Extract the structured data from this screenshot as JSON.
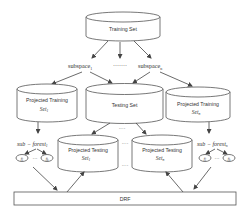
{
  "diagram": {
    "training_set": {
      "label": "Training Set"
    },
    "subspaces": {
      "first": {
        "base": "subspace",
        "sub": "1"
      },
      "ellipsis": "·······",
      "last": {
        "base": "subspace",
        "sub": "n"
      }
    },
    "projected_training": [
      {
        "line1": "Projected Training",
        "base": "Set",
        "sub": "1"
      },
      {
        "line1": "Projected Training",
        "base": "Set",
        "sub": "n"
      }
    ],
    "testing_set": {
      "label": "Testing Set",
      "ellipsis": "····"
    },
    "sub_forests": [
      {
        "base": "sub − forest",
        "sub": "1",
        "tree_first": "f",
        "tree_first_sub": "1",
        "tree_dots": "···",
        "tree_last": "f",
        "tree_last_sub": "k"
      },
      {
        "base": "sub − forest",
        "sub": "n",
        "tree_first": "f",
        "tree_first_sub": "1",
        "tree_dots": "···",
        "tree_last": "f",
        "tree_last_sub": "k"
      }
    ],
    "projected_testing": [
      {
        "line1": "Projected Testing",
        "base": "Set",
        "sub": "1"
      },
      {
        "line1": "Projected Testing",
        "base": "Set",
        "sub": "n"
      }
    ],
    "between_dots_top": "····",
    "between_dots_bottom": "····",
    "drf": {
      "label": "DRF"
    }
  }
}
